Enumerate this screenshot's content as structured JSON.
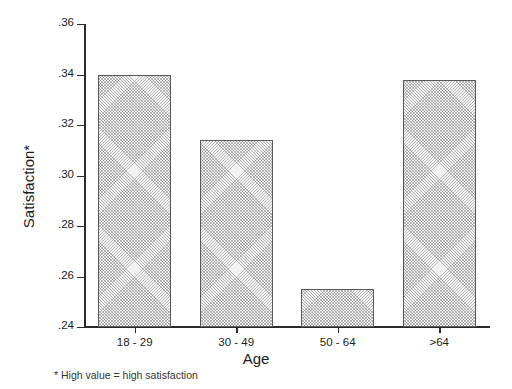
{
  "chart_data": {
    "type": "bar",
    "title": "",
    "subtitle": "",
    "xlabel": "Age",
    "ylabel": "Satisfaction*",
    "categories": [
      "18 - 29",
      "30 - 49",
      "50 - 64",
      ">64"
    ],
    "values": [
      0.34,
      0.314,
      0.255,
      0.338
    ],
    "series": [
      {
        "name": "Satisfaction",
        "values": [
          0.34,
          0.314,
          0.255,
          0.338
        ]
      }
    ],
    "ylim": [
      0.24,
      0.36
    ],
    "ytick_labels": [
      ".24",
      ".26",
      ".28",
      ".30",
      ".32",
      ".34",
      ".36"
    ],
    "ytick_values": [
      0.24,
      0.26,
      0.28,
      0.3,
      0.32,
      0.34,
      0.36
    ],
    "grid": false,
    "legend": "none",
    "bar_fill": "#f2f2f2",
    "bar_edge": "#5a5a5a",
    "axis_color": "#2b2b2b",
    "background": "#ffffff",
    "footnote": "* High value = high satisfaction"
  }
}
